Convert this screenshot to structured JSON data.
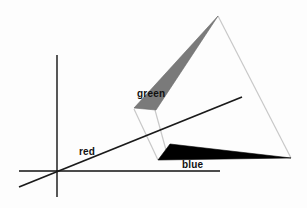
{
  "diagram": {
    "labels": {
      "green": "green",
      "red": "red",
      "blue": "blue"
    },
    "colors": {
      "axis": "#111111",
      "red_line": "#1a1a1a",
      "green_triangle": "#7a7a7a",
      "blue_triangle": "#000000",
      "projection_lines": "#c8c8c8"
    },
    "axes": {
      "vertical": {
        "x": 57,
        "y1": 55,
        "y2": 197
      },
      "horizontal": {
        "y": 171,
        "x1": 19,
        "x2": 220
      }
    },
    "red_line": {
      "x1": 19,
      "y1": 187,
      "x2": 242,
      "y2": 97
    },
    "green_triangle": [
      [
        218,
        16
      ],
      [
        134,
        108
      ],
      [
        156,
        110
      ]
    ],
    "blue_triangle": [
      [
        158,
        160
      ],
      [
        170,
        144
      ],
      [
        291,
        158
      ]
    ],
    "projection_lines": [
      [
        [
          134,
          109
        ],
        [
          158,
          160
        ]
      ],
      [
        [
          155,
          110
        ],
        [
          166,
          150
        ]
      ],
      [
        [
          218,
          16
        ],
        [
          291,
          158
        ]
      ]
    ]
  }
}
